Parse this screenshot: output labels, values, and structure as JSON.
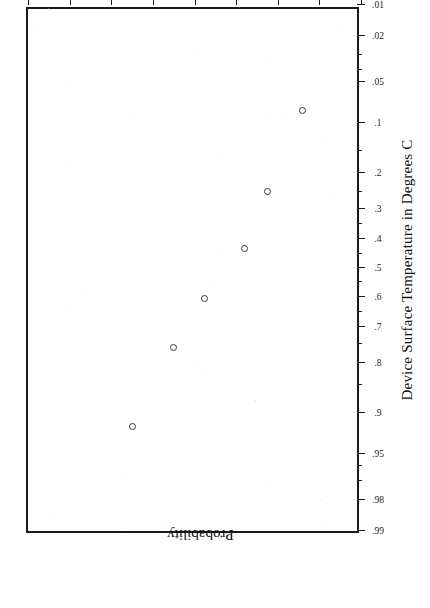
{
  "chart_data": {
    "type": "scatter",
    "title": "",
    "subtitle": "",
    "plot_kind": "normal-probability-plot",
    "orientation": "rotated-90-ccw",
    "xlabel": "Device Surface Temperature in Degrees C",
    "ylabel": "Probability",
    "xlim": [
      165,
      181
    ],
    "ylim": [
      0.01,
      0.99
    ],
    "grid": false,
    "legend": null,
    "x_ticks": [
      "165.",
      "167.",
      "169.",
      "171.",
      "173.",
      "175.",
      "177.",
      "179.",
      "181."
    ],
    "x_tick_values": [
      165,
      167,
      169,
      171,
      173,
      175,
      177,
      179,
      181
    ],
    "y_ticks": [
      ".01",
      ".02",
      ".05",
      ".1",
      ".2",
      ".3",
      ".4",
      ".5",
      ".6",
      ".7",
      ".8",
      ".9",
      ".95",
      ".98",
      ".99"
    ],
    "y_tick_values": [
      0.01,
      0.02,
      0.05,
      0.1,
      0.2,
      0.3,
      0.4,
      0.5,
      0.6,
      0.7,
      0.8,
      0.9,
      0.95,
      0.98,
      0.99
    ],
    "y_minor_tick_values": [
      0.03,
      0.04,
      0.15,
      0.25,
      0.35,
      0.45,
      0.55,
      0.65,
      0.75,
      0.85,
      0.96,
      0.97
    ],
    "x": [
      167.8,
      169.5,
      170.6,
      172.5,
      174.0,
      176.0
    ],
    "y": [
      0.082,
      0.25,
      0.43,
      0.605,
      0.76,
      0.92
    ],
    "points": [
      {
        "x": 167.8,
        "y": 0.082
      },
      {
        "x": 169.5,
        "y": 0.25
      },
      {
        "x": 170.6,
        "y": 0.43
      },
      {
        "x": 172.5,
        "y": 0.605
      },
      {
        "x": 174.0,
        "y": 0.76
      },
      {
        "x": 176.0,
        "y": 0.92
      }
    ],
    "marker": "open-circle",
    "marker_color": "#3a3a3a",
    "frame_color": "#1a1a1a",
    "background_color": "#ffffff"
  }
}
